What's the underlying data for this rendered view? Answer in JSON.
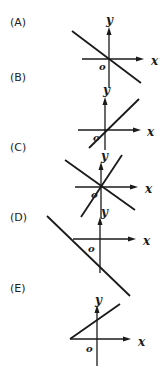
{
  "options": [
    {
      "label": "(A)",
      "axis_labels": {
        "x": "x",
        "y": "y",
        "origin": "o"
      },
      "description": "Line through origin with negative slope"
    },
    {
      "label": "(B)",
      "axis_labels": {
        "x": "x",
        "y": "y",
        "origin": "o"
      },
      "description": "Line through origin with positive slope"
    },
    {
      "label": "(C)",
      "axis_labels": {
        "x": "x",
        "y": "y",
        "origin": "o"
      },
      "description": "Two lines through origin, one positive and one negative slope"
    },
    {
      "label": "(D)",
      "axis_labels": {
        "x": "x",
        "y": "y",
        "origin": "o"
      },
      "description": "Line with negative slope and negative y-intercept"
    },
    {
      "label": "(E)",
      "axis_labels": {
        "x": "x",
        "y": "y",
        "origin": "o"
      },
      "description": "Ray with positive slope starting on negative x-axis, positive y-intercept"
    }
  ]
}
